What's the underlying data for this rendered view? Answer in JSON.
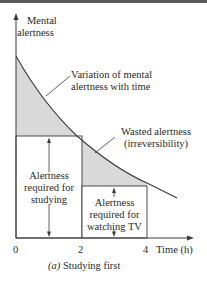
{
  "diagram": {
    "y_axis_label_line1": "Mental",
    "y_axis_label_line2": "alertness",
    "x_axis_label": "Time (h)",
    "x_ticks": [
      "0",
      "2",
      "4"
    ],
    "curve_label_line1": "Variation of mental",
    "curve_label_line2": "alertness with time",
    "wasted_label_line1": "Wasted alertness",
    "wasted_label_line2": "(irreversibility)",
    "studying_label_line1": "Alertness",
    "studying_label_line2": "required for",
    "studying_label_line3": "studying",
    "tv_label_line1": "Alertness",
    "tv_label_line2": "required for",
    "tv_label_line3": "watching TV",
    "caption_prefix": "(a)",
    "caption": "Studying first",
    "colors": {
      "shade": "#d9d9d9",
      "line": "#3a3a3a",
      "text": "#2a2a2a"
    }
  }
}
